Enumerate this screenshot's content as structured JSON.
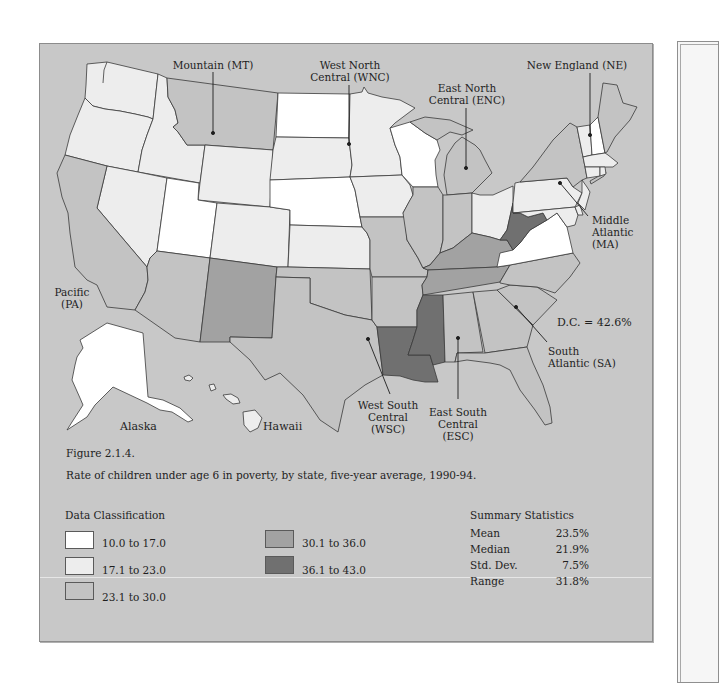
{
  "figure": {
    "number": "Figure 2.1.4.",
    "caption": "Rate of children under age 6 in poverty, by state, five-year average, 1990-94."
  },
  "map": {
    "regions": {
      "mountain": {
        "line1": "Mountain (MT)"
      },
      "west_north_central": {
        "line1": "West North",
        "line2": "Central (WNC)"
      },
      "east_north_central": {
        "line1": "East North",
        "line2": "Central (ENC)"
      },
      "new_england": {
        "line1": "New England (NE)"
      },
      "middle_atlantic": {
        "line1": "Middle",
        "line2": "Atlantic",
        "line3": "(MA)"
      },
      "south_atlantic": {
        "line1": "South",
        "line2": "Atlantic (SA)"
      },
      "west_south_central": {
        "line1": "West South",
        "line2": "Central",
        "line3": "(WSC)"
      },
      "east_south_central": {
        "line1": "East South",
        "line2": "Central",
        "line3": "(ESC)"
      },
      "pacific": {
        "line1": "Pacific",
        "line2": "(PA)"
      }
    },
    "insets": {
      "alaska": "Alaska",
      "hawaii": "Hawaii"
    },
    "dc_note": "D.C. = 42.6%"
  },
  "legend": {
    "title": "Data Classification",
    "classes": [
      {
        "label": "10.0 to 17.0",
        "color": "#ffffff"
      },
      {
        "label": "17.1 to 23.0",
        "color": "#ededed"
      },
      {
        "label": "23.1 to 30.0",
        "color": "#c3c3c3"
      },
      {
        "label": "30.1 to 36.0",
        "color": "#a2a2a2"
      },
      {
        "label": "36.1 to 43.0",
        "color": "#707070"
      }
    ]
  },
  "summary": {
    "title": "Summary Statistics",
    "rows": [
      {
        "label": "Mean",
        "value": "23.5%"
      },
      {
        "label": "Median",
        "value": "21.9%"
      },
      {
        "label": "Std. Dev.",
        "value": "7.5%"
      },
      {
        "label": "Range",
        "value": "31.8%"
      }
    ]
  },
  "map_data": {
    "type": "choropleth",
    "class_ranges": [
      "10.0-17.0",
      "17.1-23.0",
      "23.1-30.0",
      "30.1-36.0",
      "36.1-43.0"
    ],
    "dc_value": 42.6,
    "state_class": {
      "ND": 0,
      "NE": 0,
      "UT": 0,
      "WI": 0,
      "VA": 0,
      "NH": 0,
      "AK": 0,
      "WA": 1,
      "OR": 1,
      "ID": 1,
      "NV": 1,
      "WY": 1,
      "CO": 1,
      "SD": 1,
      "MN": 1,
      "KS": 1,
      "IA": 1,
      "OH": 1,
      "PA": 1,
      "NJ": 1,
      "DE": 1,
      "MD": 1,
      "VT": 1,
      "MA": 1,
      "CT": 1,
      "RI": 1,
      "HI": 1,
      "CA": 2,
      "AZ": 2,
      "MT": 2,
      "TX": 2,
      "OK": 2,
      "MO": 2,
      "AR": 2,
      "IL": 2,
      "IN": 2,
      "MI": 2,
      "AL": 2,
      "GA": 2,
      "FL": 2,
      "SC": 2,
      "NC": 2,
      "NY": 2,
      "ME": 2,
      "NM": 3,
      "KY": 3,
      "TN": 3,
      "LA": 4,
      "MS": 4,
      "WV": 4
    }
  },
  "colors": {
    "panel_bg": "#c8c8c8",
    "boundary": "#3a3a3a"
  }
}
